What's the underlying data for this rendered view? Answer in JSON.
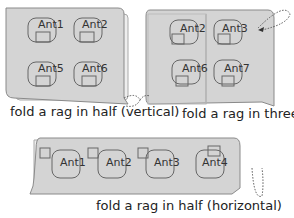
{
  "panels": [
    {
      "id": "vertical",
      "caption": "fold a rag in half (vertical)",
      "ants": [
        "Ant1",
        "Ant2",
        "Ant5",
        "Ant6"
      ]
    },
    {
      "id": "three",
      "caption": "fold a rag in three",
      "ants": [
        "Ant2",
        "Ant3",
        "Ant6",
        "Ant7"
      ]
    },
    {
      "id": "horizontal",
      "caption": "fold a rag in half (horizontal)",
      "ants": [
        "Ant1",
        "Ant2",
        "Ant3",
        "Ant4"
      ]
    }
  ],
  "colors": {
    "rag": "#d4d4d4",
    "rag_stroke": "#8a8a8a",
    "back": "#eeeeee",
    "text": "#222222"
  }
}
